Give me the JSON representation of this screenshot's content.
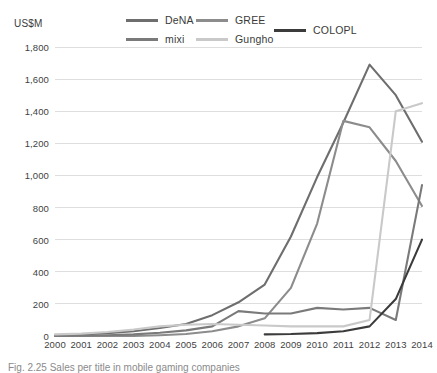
{
  "axis_title": "US$M",
  "caption": "Fig. 2.25   Sales per title in mobile gaming companies",
  "legend": {
    "items": [
      {
        "label": "DeNA",
        "color": "#6e6e6e"
      },
      {
        "label": "GREE",
        "color": "#8c8c8c"
      },
      {
        "label": "mixi",
        "color": "#7a7a7a"
      },
      {
        "label": "Gungho",
        "color": "#c9c9c9"
      },
      {
        "label": "COLOPL",
        "color": "#3b3b3b"
      }
    ]
  },
  "chart_data": {
    "type": "line",
    "title": "",
    "xlabel": "",
    "ylabel": "US$M",
    "ylim": [
      0,
      1800
    ],
    "ytick_step": 200,
    "grid": true,
    "legend_position": "top",
    "ytick_labels": [
      "1,800",
      "1,600",
      "1,400",
      "1,200",
      "1,000",
      "800",
      "600",
      "400",
      "200",
      "0"
    ],
    "ytick_values": [
      1800,
      1600,
      1400,
      1200,
      1000,
      800,
      600,
      400,
      200,
      0
    ],
    "categories": [
      "2000",
      "2001",
      "2002",
      "2003",
      "2004",
      "2005",
      "2006",
      "2007",
      "2008",
      "2009",
      "2010",
      "2011",
      "2012",
      "2013",
      "2014"
    ],
    "x": [
      2000,
      2001,
      2002,
      2003,
      2004,
      2005,
      2006,
      2007,
      2008,
      2009,
      2010,
      2011,
      2012,
      2013,
      2014
    ],
    "series": [
      {
        "name": "DeNA",
        "color": "#6e6e6e",
        "values": [
          5,
          10,
          18,
          30,
          50,
          75,
          130,
          210,
          320,
          620,
          990,
          1330,
          1690,
          1500,
          1210
        ]
      },
      {
        "name": "GREE",
        "color": "#8c8c8c",
        "values": [
          0,
          0,
          0,
          0,
          5,
          12,
          30,
          60,
          110,
          300,
          700,
          1340,
          1300,
          1090,
          810
        ]
      },
      {
        "name": "mixi",
        "color": "#7a7a7a",
        "values": [
          0,
          2,
          5,
          10,
          20,
          35,
          60,
          155,
          140,
          140,
          175,
          165,
          175,
          100,
          940
        ]
      },
      {
        "name": "Gungho",
        "color": "#c9c9c9",
        "values": [
          10,
          15,
          25,
          40,
          60,
          70,
          75,
          70,
          65,
          60,
          60,
          60,
          100,
          1400,
          1450
        ]
      },
      {
        "name": "COLOPL",
        "color": "#3b3b3b",
        "values": [
          null,
          null,
          null,
          null,
          null,
          null,
          null,
          null,
          10,
          12,
          18,
          30,
          60,
          230,
          600
        ]
      }
    ]
  }
}
